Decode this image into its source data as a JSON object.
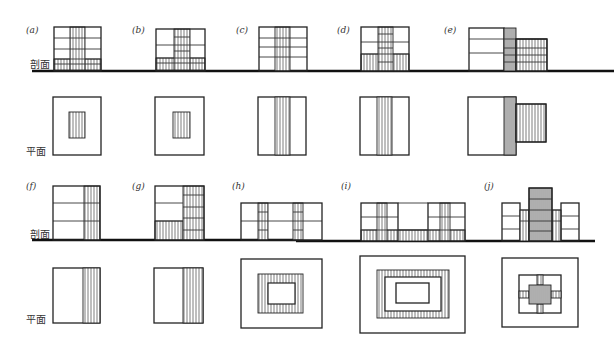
{
  "labels": {
    "section": "剖面",
    "plan": "平面"
  },
  "panels": [
    {
      "id": "a",
      "label": "(a)"
    },
    {
      "id": "b",
      "label": "(b)"
    },
    {
      "id": "c",
      "label": "(c)"
    },
    {
      "id": "d",
      "label": "(d)"
    },
    {
      "id": "e",
      "label": "(e)"
    },
    {
      "id": "f",
      "label": "(f)"
    },
    {
      "id": "g",
      "label": "(g)"
    },
    {
      "id": "h",
      "label": "(h)"
    },
    {
      "id": "i",
      "label": "(i)"
    },
    {
      "id": "j",
      "label": "(j)"
    }
  ],
  "colors": {
    "line": "#222222",
    "background": "#ffffff"
  }
}
